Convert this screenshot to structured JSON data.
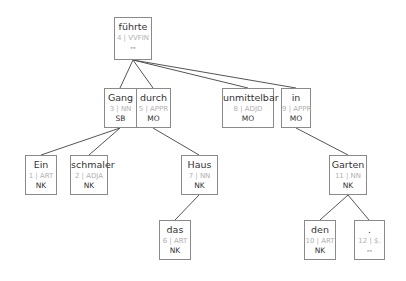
{
  "tree": {
    "nodes": [
      {
        "id": "n4",
        "word": "führte",
        "pos": "4 | VVFIN",
        "edge": "--",
        "x": 114,
        "y": 17,
        "w": 38,
        "h": 42
      },
      {
        "id": "n3",
        "word": "Gang",
        "pos": "3 | NN",
        "edge": "SB",
        "x": 104,
        "y": 88,
        "w": 33,
        "h": 40
      },
      {
        "id": "n5",
        "word": "durch",
        "pos": "5 | APPR",
        "edge": "MO",
        "x": 136,
        "y": 88,
        "w": 35,
        "h": 40
      },
      {
        "id": "n8",
        "word": "unmittelbar",
        "pos": "8 | ADJD",
        "edge": "MO",
        "x": 222,
        "y": 88,
        "w": 52,
        "h": 40
      },
      {
        "id": "n9",
        "word": "in",
        "pos": "9 | APPR",
        "edge": "MO",
        "x": 281,
        "y": 88,
        "w": 30,
        "h": 40
      },
      {
        "id": "n1",
        "word": "Ein",
        "pos": "1 | ART",
        "edge": "NK",
        "x": 25,
        "y": 155,
        "w": 32,
        "h": 40
      },
      {
        "id": "n2",
        "word": "schmaler",
        "pos": "2 | ADJA",
        "edge": "NK",
        "x": 70,
        "y": 155,
        "w": 38,
        "h": 40
      },
      {
        "id": "n7",
        "word": "Haus",
        "pos": "7 | NN",
        "edge": "NK",
        "x": 181,
        "y": 155,
        "w": 37,
        "h": 40
      },
      {
        "id": "n11",
        "word": "Garten",
        "pos": "11 | NN",
        "edge": "NK",
        "x": 329,
        "y": 155,
        "w": 38,
        "h": 40
      },
      {
        "id": "n6",
        "word": "das",
        "pos": "6 | ART",
        "edge": "NK",
        "x": 159,
        "y": 220,
        "w": 32,
        "h": 40
      },
      {
        "id": "n10",
        "word": "den",
        "pos": "10 | ART",
        "edge": "NK",
        "x": 304,
        "y": 220,
        "w": 32,
        "h": 40
      },
      {
        "id": "n12",
        "word": ".",
        "pos": "12 | $.",
        "edge": "--",
        "x": 354,
        "y": 220,
        "w": 31,
        "h": 40
      }
    ],
    "edges": [
      {
        "from": "n4",
        "to": "n3"
      },
      {
        "from": "n4",
        "to": "n5"
      },
      {
        "from": "n4",
        "to": "n8"
      },
      {
        "from": "n4",
        "to": "n9"
      },
      {
        "from": "n3",
        "to": "n1"
      },
      {
        "from": "n3",
        "to": "n2"
      },
      {
        "from": "n5",
        "to": "n7"
      },
      {
        "from": "n7",
        "to": "n6"
      },
      {
        "from": "n9",
        "to": "n11"
      },
      {
        "from": "n11",
        "to": "n10"
      },
      {
        "from": "n11",
        "to": "n12"
      }
    ],
    "colors": {
      "border": "#8a8a8a",
      "edge_line": "#555555",
      "word": "#333333",
      "pos": "#b0b0b0"
    }
  }
}
